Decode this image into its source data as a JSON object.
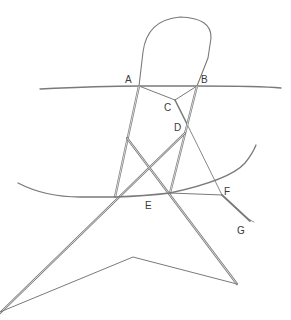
{
  "diagram": {
    "type": "geometric line diagram",
    "background": "#ffffff",
    "stroke_color": "#6e6e6e",
    "labels": [
      {
        "id": "A",
        "text": "A",
        "x": 125,
        "y": 83
      },
      {
        "id": "B",
        "text": "B",
        "x": 201,
        "y": 83
      },
      {
        "id": "C",
        "text": "C",
        "x": 164,
        "y": 111
      },
      {
        "id": "D",
        "text": "D",
        "x": 174,
        "y": 131
      },
      {
        "id": "E",
        "text": "E",
        "x": 145,
        "y": 209
      },
      {
        "id": "F",
        "text": "F",
        "x": 224,
        "y": 195
      },
      {
        "id": "G",
        "text": "G",
        "x": 237,
        "y": 234
      }
    ],
    "points": {
      "A": [
        139,
        86
      ],
      "B": [
        197,
        86
      ],
      "C": [
        175,
        100
      ],
      "D": [
        187,
        124
      ],
      "E_left": [
        115,
        197
      ],
      "E_right": [
        170,
        193
      ],
      "F": [
        222,
        195
      ],
      "G": [
        251,
        222
      ]
    }
  }
}
